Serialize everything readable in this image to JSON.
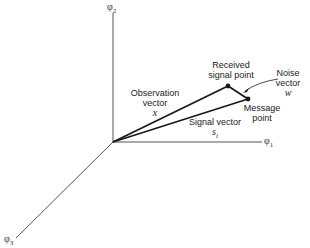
{
  "diagram": {
    "axes": {
      "phi1": {
        "symbol": "φ",
        "sub": "1"
      },
      "phi2": {
        "symbol": "φ",
        "sub": "2"
      },
      "phi3": {
        "symbol": "φ",
        "sub": "3"
      }
    },
    "labels": {
      "received_line1": "Received",
      "received_line2": "signal point",
      "noise_line1": "Noise",
      "noise_line2": "vector",
      "noise_symbol": "w",
      "observation_line1": "Observation",
      "observation_line2": "vector",
      "observation_symbol": "x",
      "signal_line1": "Signal vector",
      "signal_symbol": "s",
      "signal_sub": "i",
      "message_line1": "Message",
      "message_line2": "point"
    },
    "colors": {
      "line": "#1a1a1a",
      "axis": "#555555"
    }
  }
}
